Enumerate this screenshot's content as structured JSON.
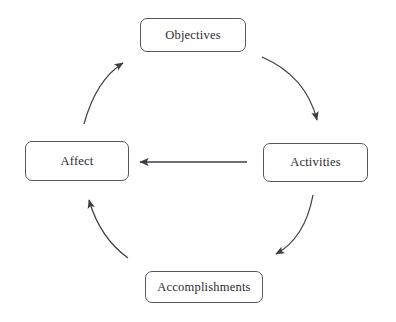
{
  "diagram": {
    "background_color": "#ffffff",
    "stroke_color": "#56565e",
    "text_color": "#2b2b30",
    "nodes": [
      {
        "id": "objectives",
        "label": "Objectives",
        "position": "top"
      },
      {
        "id": "activities",
        "label": "Activities",
        "position": "right"
      },
      {
        "id": "accomplishments",
        "label": "Accomplishments",
        "position": "bottom"
      },
      {
        "id": "affect",
        "label": "Affect",
        "position": "left"
      }
    ],
    "connectors": [
      {
        "id": "objectives-to-activities",
        "from": "objectives",
        "to": "activities",
        "style": "curved",
        "direction": "clockwise"
      },
      {
        "id": "activities-to-accomplishments",
        "from": "activities",
        "to": "accomplishments",
        "style": "curved",
        "direction": "clockwise"
      },
      {
        "id": "accomplishments-to-affect",
        "from": "accomplishments",
        "to": "affect",
        "style": "curved",
        "direction": "clockwise"
      },
      {
        "id": "affect-to-objectives",
        "from": "affect",
        "to": "objectives",
        "style": "curved",
        "direction": "clockwise"
      },
      {
        "id": "activities-to-affect",
        "from": "activities",
        "to": "affect",
        "style": "straight",
        "direction": "leftward"
      }
    ]
  }
}
